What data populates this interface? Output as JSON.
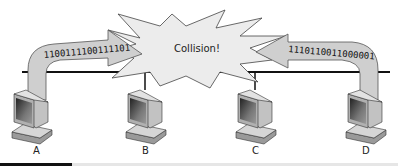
{
  "diagram": {
    "collision_label": "Collision!",
    "left_bits": "1100111100111101",
    "right_bits": "1110110011000001",
    "nodes": [
      {
        "label": "A",
        "x": 28
      },
      {
        "label": "B",
        "x": 145
      },
      {
        "label": "C",
        "x": 255
      },
      {
        "label": "D",
        "x": 365
      }
    ],
    "colors": {
      "bus": "#111111",
      "arrow_fill": "#cfcfcf",
      "arrow_stroke": "#555555",
      "burst_fill": "#ececec",
      "burst_stroke": "#444444"
    }
  }
}
